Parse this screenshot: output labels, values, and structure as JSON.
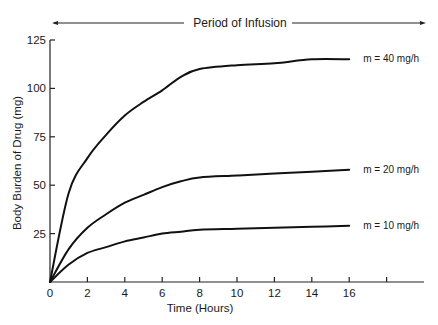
{
  "chart_data": {
    "type": "line",
    "title": "",
    "annotation": "Period of Infusion",
    "xlabel": "Time (Hours)",
    "ylabel": "Body Burden of Drug (mg)",
    "xlim": [
      0,
      20
    ],
    "ylim": [
      0,
      125
    ],
    "xticks": [
      0,
      2,
      4,
      6,
      8,
      10,
      12,
      14,
      16,
      18
    ],
    "xtick_labels": [
      "0",
      "2",
      "4",
      "6",
      "8",
      "10",
      "12",
      "14",
      "16",
      ""
    ],
    "yticks": [
      0,
      25,
      50,
      75,
      100,
      125
    ],
    "ytick_labels": [
      "0",
      "25",
      "50",
      "75",
      "100",
      "125"
    ],
    "grid": false,
    "legend": "inline labels at right end of each curve",
    "x": [
      0,
      1,
      2,
      3,
      4,
      5,
      6,
      7,
      8,
      10,
      12,
      14,
      16
    ],
    "series": [
      {
        "name": "m = 40 mg/h",
        "values": [
          0,
          46,
          64,
          76,
          86,
          93,
          99,
          106,
          110,
          112,
          113,
          115,
          115
        ]
      },
      {
        "name": "m = 20 mg/h",
        "values": [
          0,
          17,
          28,
          35,
          41,
          45,
          49,
          52,
          54,
          55,
          56,
          57,
          58
        ]
      },
      {
        "name": "m = 10 mg/h",
        "values": [
          0,
          9,
          15,
          18,
          21,
          23,
          25,
          26,
          27,
          27.5,
          28,
          28.5,
          29
        ]
      }
    ]
  }
}
